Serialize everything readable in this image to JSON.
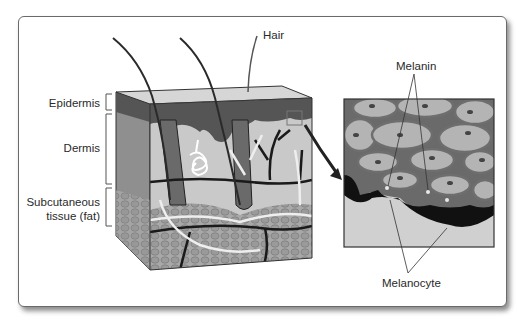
{
  "figure": {
    "labels": {
      "hair": "Hair",
      "epidermis": "Epidermis",
      "dermis": "Dermis",
      "subcutaneous_line1": "Subcutaneous",
      "subcutaneous_line2": "tissue (fat)",
      "melanin": "Melanin",
      "melanocyte": "Melanocyte"
    },
    "colors": {
      "epidermis": "#555555",
      "dermis": "#c8c8c8",
      "fat": "#9a9a9a",
      "vessels_dark": "#1a1a1a",
      "vessels_light": "#eeeeee",
      "cell_fill": "#b4b4b4",
      "cell_border": "#6e6e6e",
      "melanocyte": "#111111"
    }
  }
}
